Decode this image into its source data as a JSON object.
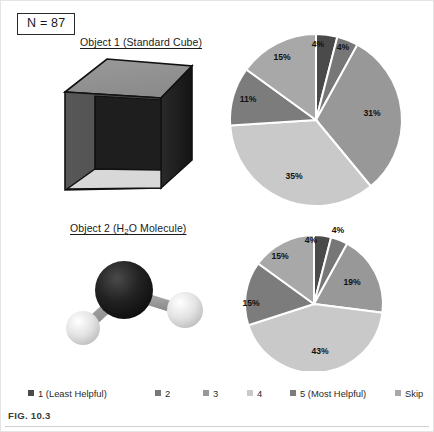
{
  "figure": {
    "caption": "FIG. 10.3",
    "sample_size_label": "N = 87"
  },
  "objects": [
    {
      "key": "object1",
      "title": "Object 1 (Standard Cube)",
      "icon": "cube-3d-icon"
    },
    {
      "key": "object2",
      "title_prefix": "Object 2 (H",
      "title_sub": "2",
      "title_suffix": "O Molecule)",
      "icon": "water-molecule-icon"
    }
  ],
  "legend": {
    "position": "bottom",
    "items": [
      {
        "label": "1 (Least Helpful)",
        "color": "#4a4a4a",
        "x": 28
      },
      {
        "label": "2",
        "color": "#777777",
        "x": 155
      },
      {
        "label": "3",
        "color": "#989898",
        "x": 203
      },
      {
        "label": "4",
        "color": "#c9c9c9",
        "x": 247
      },
      {
        "label": "5 (Most Helpful)",
        "color": "#7c7c7c",
        "x": 290
      },
      {
        "label": "Skip",
        "color": "#a8a8a8",
        "x": 395
      }
    ]
  },
  "chart_data": [
    {
      "type": "pie",
      "title": "Object 1 (Standard Cube)",
      "legend_position": "bottom",
      "categories": [
        "1 (Least Helpful)",
        "2",
        "3",
        "4",
        "5 (Most Helpful)",
        "Skip"
      ],
      "labels": [
        "4%",
        "4%",
        "31%",
        "35%",
        "11%",
        "15%"
      ],
      "values": [
        4,
        4,
        31,
        35,
        11,
        15
      ],
      "colors": [
        "#4a4a4a",
        "#777777",
        "#989898",
        "#c9c9c9",
        "#7c7c7c",
        "#a8a8a8"
      ],
      "start_angle_deg": 0,
      "direction": "clockwise",
      "cx": 90,
      "cy": 89,
      "r": 86,
      "label_positions": [
        {
          "x": 92,
          "y": 16
        },
        {
          "x": 117,
          "y": 19
        },
        {
          "x": 146,
          "y": 85
        },
        {
          "x": 68,
          "y": 148
        },
        {
          "x": 22,
          "y": 71
        },
        {
          "x": 56,
          "y": 29
        }
      ]
    },
    {
      "type": "pie",
      "title": "Object 2 (H2O Molecule)",
      "legend_position": "bottom",
      "categories": [
        "1 (Least Helpful)",
        "2",
        "3",
        "4",
        "5 (Most Helpful)",
        "Skip"
      ],
      "labels": [
        "4%",
        "4%",
        "19%",
        "43%",
        "15%",
        "15%"
      ],
      "values": [
        4,
        4,
        19,
        43,
        15,
        15
      ],
      "colors": [
        "#4a4a4a",
        "#777777",
        "#989898",
        "#c9c9c9",
        "#7c7c7c",
        "#a8a8a8"
      ],
      "start_angle_deg": 0,
      "direction": "clockwise",
      "cx": 86,
      "cy": 78,
      "r": 69,
      "label_positions": [
        {
          "x": 83,
          "y": 17
        },
        {
          "x": 110,
          "y": 7
        },
        {
          "x": 124,
          "y": 59
        },
        {
          "x": 92,
          "y": 128
        },
        {
          "x": 23,
          "y": 80
        },
        {
          "x": 52,
          "y": 33
        }
      ]
    }
  ]
}
